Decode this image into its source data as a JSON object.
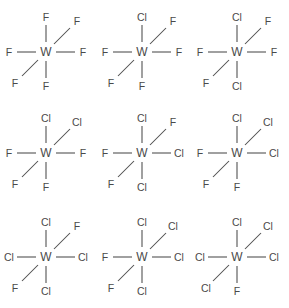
{
  "diagram": {
    "center_atom": "W",
    "colors": {
      "bond": "#4a4a4a",
      "label": "#4a4a4a",
      "background": "#ffffff"
    },
    "geometry": {
      "columns_x": [
        46,
        142,
        237
      ],
      "rows_y": [
        52,
        153,
        257
      ],
      "positions": [
        "top",
        "upper-right",
        "right",
        "bottom",
        "lower-left",
        "left"
      ]
    },
    "structures": [
      {
        "id": "structure-1",
        "formula": "WF6",
        "col": 0,
        "row": 0,
        "ligands": {
          "top": "F",
          "upper_right": "F",
          "right": "F",
          "bottom": "F",
          "lower_left": "F",
          "left": "F"
        }
      },
      {
        "id": "structure-2",
        "formula": "WClF5",
        "col": 1,
        "row": 0,
        "ligands": {
          "top": "Cl",
          "upper_right": "F",
          "right": "F",
          "bottom": "F",
          "lower_left": "F",
          "left": "F"
        }
      },
      {
        "id": "structure-3",
        "formula": "trans-WCl2F4",
        "col": 2,
        "row": 0,
        "ligands": {
          "top": "Cl",
          "upper_right": "F",
          "right": "F",
          "bottom": "Cl",
          "lower_left": "F",
          "left": "F"
        }
      },
      {
        "id": "structure-4",
        "formula": "cis-WCl2F4",
        "col": 0,
        "row": 1,
        "ligands": {
          "top": "Cl",
          "upper_right": "Cl",
          "right": "F",
          "bottom": "F",
          "lower_left": "F",
          "left": "F"
        }
      },
      {
        "id": "structure-5",
        "formula": "mer-WCl3F3",
        "col": 1,
        "row": 1,
        "ligands": {
          "top": "Cl",
          "upper_right": "F",
          "right": "Cl",
          "bottom": "Cl",
          "lower_left": "F",
          "left": "F"
        }
      },
      {
        "id": "structure-6",
        "formula": "fac-WCl3F3",
        "col": 2,
        "row": 1,
        "ligands": {
          "top": "Cl",
          "upper_right": "Cl",
          "right": "Cl",
          "bottom": "F",
          "lower_left": "F",
          "left": "F"
        }
      },
      {
        "id": "structure-7",
        "formula": "WCl4F2",
        "col": 0,
        "row": 2,
        "ligands": {
          "top": "Cl",
          "upper_right": "F",
          "right": "Cl",
          "bottom": "Cl",
          "lower_left": "F",
          "left": "Cl"
        }
      },
      {
        "id": "structure-8",
        "formula": "WCl4F2 isomer",
        "col": 1,
        "row": 2,
        "ligands": {
          "top": "Cl",
          "upper_right": "Cl",
          "right": "Cl",
          "bottom": "Cl",
          "lower_left": "F",
          "left": "F"
        }
      },
      {
        "id": "structure-9",
        "formula": "WCl5F",
        "col": 2,
        "row": 2,
        "ligands": {
          "top": "Cl",
          "upper_right": "Cl",
          "right": "Cl",
          "bottom": "F",
          "lower_left": "Cl",
          "left": "Cl"
        }
      }
    ]
  }
}
